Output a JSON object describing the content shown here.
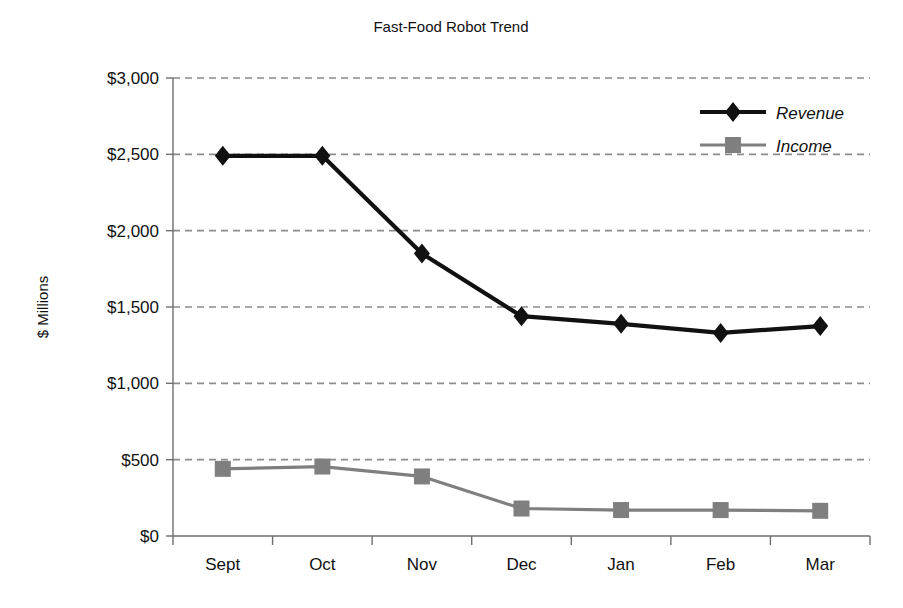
{
  "chart_data": {
    "type": "line",
    "title": "Fast-Food Robot Trend",
    "xlabel": "",
    "ylabel": "$ Millions",
    "categories": [
      "Sept",
      "Oct",
      "Nov",
      "Dec",
      "Jan",
      "Feb",
      "Mar"
    ],
    "series": [
      {
        "name": "Revenue",
        "values": [
          2490,
          2490,
          1850,
          1440,
          1390,
          1330,
          1375
        ],
        "color": "#111111",
        "marker": "diamond"
      },
      {
        "name": "Income",
        "values": [
          440,
          455,
          390,
          180,
          170,
          170,
          165
        ],
        "color": "#7f7f7f",
        "marker": "square"
      }
    ],
    "ylim": [
      0,
      3000
    ],
    "ytick_values": [
      0,
      500,
      1000,
      1500,
      2000,
      2500,
      3000
    ],
    "ytick_labels": [
      "$0",
      "$500",
      "$1,000",
      "$1,500",
      "$2,000",
      "$2,500",
      "$3,000"
    ],
    "grid": true,
    "grid_style": "dashed",
    "grid_color": "#8c8c8c",
    "legend_position": "top-right",
    "axis_color": "#6f6f6f",
    "background": "#ffffff"
  },
  "legend": {
    "entries": [
      {
        "label": "Revenue"
      },
      {
        "label": "Income"
      }
    ]
  }
}
